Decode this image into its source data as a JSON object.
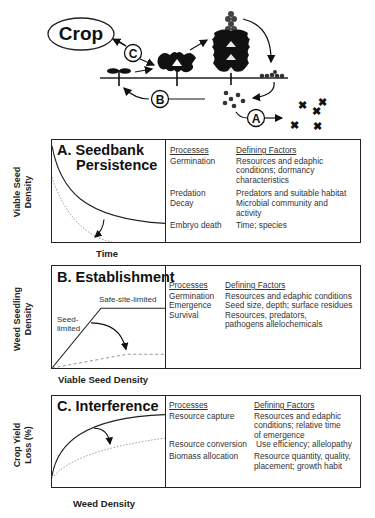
{
  "life_cycle": {
    "crop_label": "Crop",
    "markers": {
      "a": "A",
      "b": "B",
      "c": "C"
    },
    "stages": [
      "seedling",
      "rosette",
      "mature-plant",
      "seed-rain",
      "seedbank",
      "seed-loss"
    ]
  },
  "panels": [
    {
      "id": "A",
      "title_line1": "A. Seedbank",
      "title_line2": "Persistence",
      "y_label_line1": "Viable Seed",
      "y_label_line2": "Density",
      "x_label": "Time",
      "headers": {
        "processes": "Processes",
        "factors": "Defining Factors"
      },
      "rows": [
        {
          "process": "Germination",
          "factor": "Resources and edaphic conditions; dormancy characteristics"
        },
        {
          "process": "Predation",
          "factor": "Predators and suitable habitat"
        },
        {
          "process": "Decay",
          "factor": "Microbial community and activity"
        },
        {
          "process": "Embryo death",
          "factor": "Time; species"
        }
      ]
    },
    {
      "id": "B",
      "title": "B. Establishment",
      "y_label_line1": "Weed Seedling",
      "y_label_line2": "Density",
      "x_label": "Viable Seed Density",
      "annotation_upper": "Safe-site-limited",
      "annotation_lower_line1": "Seed-",
      "annotation_lower_line2": "limited",
      "headers": {
        "processes": "Processes",
        "factors": "Defining Factors"
      },
      "rows": [
        {
          "process": "Germination",
          "factor": "Resources and edaphic conditions"
        },
        {
          "process": "Emergence",
          "factor": "Seed size, depth; surface residues"
        },
        {
          "process": "Survival",
          "factor": "Resources, predators, pathogens allelochemicals"
        }
      ]
    },
    {
      "id": "C",
      "title": "C. Interference",
      "y_label_line1": "Crop Yield",
      "y_label_line2": "Loss (%)",
      "x_label": "Weed Density",
      "headers": {
        "processes": "Processes",
        "factors": "Defining Factors"
      },
      "rows": [
        {
          "process": "Resource capture",
          "factor": "Resources and edaphic conditions; relative time of emergence"
        },
        {
          "process": "Resource conversion",
          "factor": "Use efficiency; allelopathy"
        },
        {
          "process": "Biomass allocation",
          "factor": "Resource quantity, quality, placement; growth habit"
        }
      ]
    }
  ]
}
